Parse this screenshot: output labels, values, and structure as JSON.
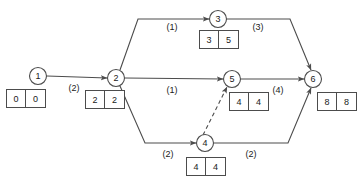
{
  "diagram": {
    "type": "activity-on-arrow-network",
    "nodes": [
      {
        "id": "1",
        "label": "1",
        "cx": 38,
        "cy": 76,
        "r": 8.5,
        "early": "0",
        "late": "0",
        "box_x": 6,
        "box_y": 89
      },
      {
        "id": "2",
        "label": "2",
        "cx": 116,
        "cy": 78,
        "r": 8.5,
        "early": "2",
        "late": "2",
        "box_x": 85,
        "box_y": 90
      },
      {
        "id": "3",
        "label": "3",
        "cx": 218,
        "cy": 19,
        "r": 8.5,
        "early": "3",
        "late": "5",
        "box_x": 199,
        "box_y": 30
      },
      {
        "id": "4",
        "label": "4",
        "cx": 205,
        "cy": 143,
        "r": 8.5,
        "early": "4",
        "late": "4",
        "box_x": 186,
        "box_y": 157
      },
      {
        "id": "5",
        "label": "5",
        "cx": 232,
        "cy": 79,
        "r": 8.5,
        "early": "4",
        "late": "4",
        "box_x": 229,
        "box_y": 92
      },
      {
        "id": "6",
        "label": "6",
        "cx": 313,
        "cy": 79,
        "r": 8.5,
        "early": "8",
        "late": "8",
        "box_x": 317,
        "box_y": 92
      }
    ],
    "edges": [
      {
        "id": "e1-2",
        "from": "1",
        "to": "2",
        "duration": "(2)",
        "style": "solid",
        "label_x": 74,
        "label_y": 89,
        "path": "M 47 76 L 107 78"
      },
      {
        "id": "e2-3",
        "from": "2",
        "to": "3",
        "duration": "(1)",
        "style": "solid",
        "label_x": 172,
        "label_y": 28,
        "path": "M 120 70 L 138 19 L 209 19"
      },
      {
        "id": "e2-5",
        "from": "2",
        "to": "5",
        "duration": "(1)",
        "style": "solid",
        "label_x": 172,
        "label_y": 91,
        "path": "M 125 78 L 223 79"
      },
      {
        "id": "e2-4",
        "from": "2",
        "to": "4",
        "duration": "(2)",
        "style": "solid",
        "label_x": 168,
        "label_y": 155,
        "path": "M 120 86 L 145 143 L 196 143"
      },
      {
        "id": "e3-6",
        "from": "3",
        "to": "6",
        "duration": "(3)",
        "style": "solid",
        "label_x": 258,
        "label_y": 28,
        "path": "M 227 19 L 290 19 L 311 70"
      },
      {
        "id": "e4-5",
        "from": "4",
        "to": "5",
        "duration": "",
        "style": "dashed",
        "label_x": 0,
        "label_y": 0,
        "path": "M 203 135 L 227 87"
      },
      {
        "id": "e5-6",
        "from": "5",
        "to": "6",
        "duration": "(4)",
        "style": "solid",
        "label_x": 278,
        "label_y": 91,
        "path": "M 241 79 L 304 79"
      },
      {
        "id": "e4-6",
        "from": "4",
        "to": "6",
        "duration": "(2)",
        "style": "solid",
        "label_x": 251,
        "label_y": 155,
        "path": "M 214 143 L 288 143 L 311 88"
      }
    ],
    "colors": {
      "stroke": "#4c4c4c",
      "text": "#1a1a1a",
      "background": "#ffffff"
    }
  }
}
